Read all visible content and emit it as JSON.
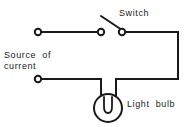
{
  "diagram": {
    "background_color": "#ffffff",
    "line_color": "#1a1a1a",
    "labels": {
      "switch": "Switch",
      "source_line1": "Source  of",
      "source_line2": "current",
      "bulb": "Light  bulb"
    },
    "components": [
      {
        "id": "source-terminal-top",
        "name": "Source terminal (top)",
        "type": "terminal",
        "x": 38,
        "y": 32,
        "r": 3.2
      },
      {
        "id": "source-terminal-bottom",
        "name": "Source terminal (bottom)",
        "type": "terminal",
        "x": 38,
        "y": 79,
        "r": 3.2
      },
      {
        "id": "switch-contact-left",
        "name": "Switch contact (left)",
        "type": "terminal",
        "x": 101,
        "y": 32,
        "r": 3.2
      },
      {
        "id": "switch-contact-right",
        "name": "Switch contact (right / pivot)",
        "type": "terminal",
        "x": 122,
        "y": 32,
        "r": 3.2
      },
      {
        "id": "switch-lever",
        "name": "Switch lever (open position)",
        "type": "lever",
        "x1": 122,
        "y1": 30,
        "x2": 101,
        "y2": 16,
        "state": "open"
      },
      {
        "id": "light-bulb",
        "name": "Light bulb",
        "type": "lamp",
        "cx": 108,
        "cy": 108,
        "r": 14
      }
    ],
    "wires": [
      {
        "id": "wire-top-left",
        "name": "Top wire: source terminal to switch",
        "path": "M 41 32 L 98 32"
      },
      {
        "id": "wire-top-right",
        "name": "Top wire: switch to right bus",
        "path": "M 125 32 L 178 32"
      },
      {
        "id": "wire-right-bus",
        "name": "Right vertical bus wire",
        "path": "M 178 32 L 178 79"
      },
      {
        "id": "wire-bottom-right",
        "name": "Bottom wire: right bus to bulb lead",
        "path": "M 178 79 L 116 79"
      },
      {
        "id": "wire-bulb-lead-right",
        "name": "Bulb lead (right)",
        "path": "M 116 79 L 116 96"
      },
      {
        "id": "wire-bottom-left",
        "name": "Bottom wire: source terminal to bulb lead",
        "path": "M 41 79 L 101 79"
      },
      {
        "id": "wire-bulb-lead-left",
        "name": "Bulb lead (left)",
        "path": "M 101 79 L 101 96"
      }
    ],
    "filament_path": "M 104 97 L 104 107 Q 104 113 108 113 Q 112 113 112 107 L 112 97"
  }
}
